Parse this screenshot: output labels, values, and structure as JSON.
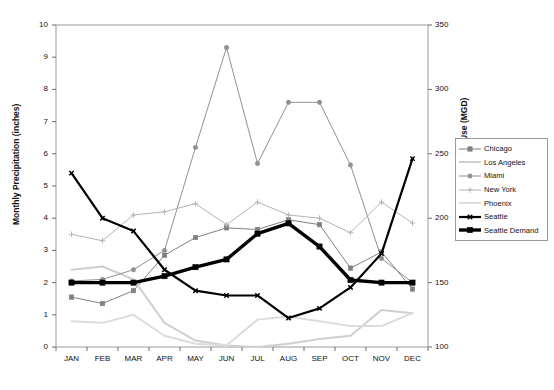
{
  "chart_data": {
    "type": "line",
    "title": "",
    "xlabel": "",
    "ylabel": "Monthly Precipitation (inches)",
    "y2label": "Average Daily Water Use (MGD)",
    "categories": [
      "JAN",
      "FEB",
      "MAR",
      "APR",
      "MAY",
      "JUN",
      "JUL",
      "AUG",
      "SEP",
      "OCT",
      "NOV",
      "DEC"
    ],
    "ylim": [
      0,
      10
    ],
    "yticks": [
      0,
      1,
      2,
      3,
      4,
      5,
      6,
      7,
      8,
      9,
      10
    ],
    "y2lim": [
      100,
      350
    ],
    "y2ticks": [
      100,
      150,
      200,
      250,
      300,
      350
    ],
    "grid": false,
    "legend_position": "right",
    "series": [
      {
        "name": "Chicago",
        "axis": "left",
        "color": "#808080",
        "marker": "square",
        "width": 1,
        "values": [
          1.55,
          1.35,
          1.75,
          2.85,
          3.4,
          3.7,
          3.65,
          3.95,
          3.8,
          2.45,
          2.95,
          1.8
        ]
      },
      {
        "name": "Los Angeles",
        "axis": "left",
        "color": "#cfcfcf",
        "marker": "none",
        "width": 2,
        "values": [
          2.4,
          2.5,
          2.1,
          0.75,
          0.2,
          0.05,
          0.0,
          0.1,
          0.25,
          0.35,
          1.15,
          1.05
        ]
      },
      {
        "name": "Miami",
        "axis": "left",
        "color": "#909090",
        "marker": "circle",
        "width": 1,
        "values": [
          2.05,
          2.1,
          2.4,
          3.0,
          6.2,
          9.3,
          5.7,
          7.6,
          7.6,
          5.65,
          2.75,
          2.0
        ]
      },
      {
        "name": "New York",
        "axis": "left",
        "color": "#b5b5b5",
        "marker": "plus",
        "width": 1,
        "values": [
          3.5,
          3.3,
          4.1,
          4.2,
          4.45,
          3.8,
          4.5,
          4.1,
          4.0,
          3.55,
          4.5,
          3.85
        ]
      },
      {
        "name": "Phoenix",
        "axis": "left",
        "color": "#dcdcdc",
        "marker": "none",
        "width": 2,
        "values": [
          0.8,
          0.75,
          1.0,
          0.35,
          0.1,
          0.05,
          0.85,
          0.95,
          0.8,
          0.65,
          0.65,
          1.05
        ]
      },
      {
        "name": "Seattle",
        "axis": "left",
        "color": "#000000",
        "marker": "x",
        "width": 2.2,
        "values": [
          5.4,
          4.0,
          3.6,
          2.4,
          1.75,
          1.6,
          1.6,
          0.9,
          1.2,
          1.85,
          2.9,
          5.85
        ]
      },
      {
        "name": "Seattle Demand",
        "axis": "right",
        "color": "#000000",
        "marker": "square",
        "width": 3.4,
        "values": [
          150,
          150,
          150,
          155,
          162,
          168,
          188,
          196,
          178,
          152,
          150,
          150
        ]
      }
    ]
  },
  "legend": {
    "items": [
      {
        "label": "Chicago"
      },
      {
        "label": "Los Angeles"
      },
      {
        "label": "Miami"
      },
      {
        "label": "New York"
      },
      {
        "label": "Phoenix"
      },
      {
        "label": "Seattle"
      },
      {
        "label": "Seattle Demand"
      }
    ]
  }
}
